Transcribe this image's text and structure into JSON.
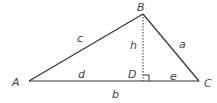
{
  "diagram": {
    "type": "triangle-with-altitude",
    "vertices": {
      "A": "A",
      "B": "B",
      "C": "C",
      "D": "D"
    },
    "sides": {
      "AB": "c",
      "BC": "a",
      "AC": "b",
      "AD": "d",
      "DC": "e",
      "BD": "h"
    },
    "colors": {
      "stroke": "#333333",
      "text": "#444444"
    }
  }
}
